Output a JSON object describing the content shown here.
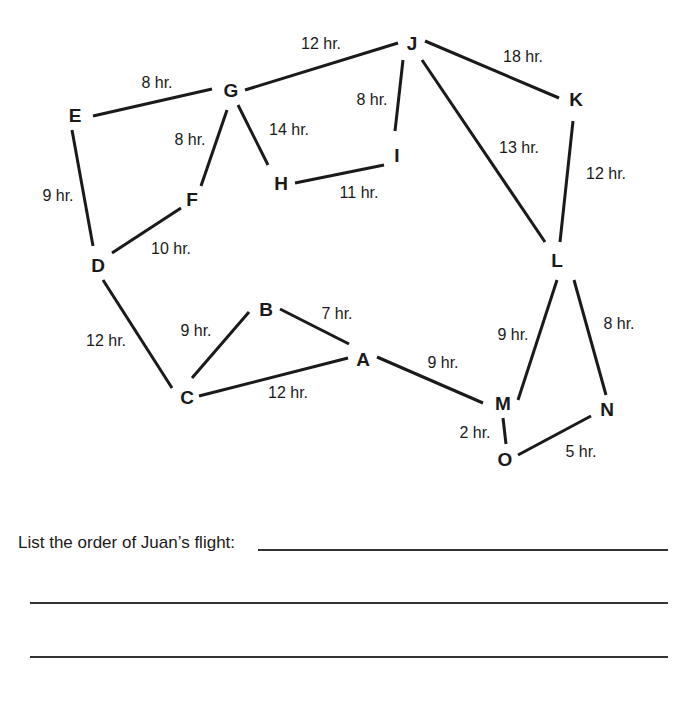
{
  "diagram": {
    "nodes": [
      {
        "id": "A",
        "label": "A",
        "x": 363,
        "y": 359
      },
      {
        "id": "B",
        "label": "B",
        "x": 266,
        "y": 309
      },
      {
        "id": "C",
        "label": "C",
        "x": 187,
        "y": 397
      },
      {
        "id": "D",
        "label": "D",
        "x": 98,
        "y": 265
      },
      {
        "id": "E",
        "label": "E",
        "x": 75,
        "y": 115
      },
      {
        "id": "F",
        "label": "F",
        "x": 192,
        "y": 199
      },
      {
        "id": "G",
        "label": "G",
        "x": 231,
        "y": 90
      },
      {
        "id": "H",
        "label": "H",
        "x": 281,
        "y": 183
      },
      {
        "id": "I",
        "label": "I",
        "x": 397,
        "y": 155
      },
      {
        "id": "J",
        "label": "J",
        "x": 412,
        "y": 43
      },
      {
        "id": "K",
        "label": "K",
        "x": 576,
        "y": 99
      },
      {
        "id": "L",
        "label": "L",
        "x": 557,
        "y": 260
      },
      {
        "id": "M",
        "label": "M",
        "x": 503,
        "y": 403
      },
      {
        "id": "N",
        "label": "N",
        "x": 607,
        "y": 409
      },
      {
        "id": "O",
        "label": "O",
        "x": 505,
        "y": 459
      }
    ],
    "edges": [
      {
        "from": "E",
        "to": "G",
        "label": "8 hr.",
        "x1": 93,
        "y1": 116,
        "x2": 212,
        "y2": 89,
        "lx": 157,
        "ly": 82
      },
      {
        "from": "G",
        "to": "J",
        "label": "12 hr.",
        "x1": 245,
        "y1": 90,
        "x2": 398,
        "y2": 43,
        "lx": 321,
        "ly": 43
      },
      {
        "from": "G",
        "to": "F",
        "label": "8 hr.",
        "x1": 227,
        "y1": 110,
        "x2": 201,
        "y2": 186,
        "lx": 190,
        "ly": 139
      },
      {
        "from": "G",
        "to": "H",
        "label": "14 hr.",
        "x1": 238,
        "y1": 105,
        "x2": 268,
        "y2": 165,
        "lx": 289,
        "ly": 129
      },
      {
        "from": "H",
        "to": "I",
        "label": "11 hr.",
        "x1": 295,
        "y1": 183,
        "x2": 384,
        "y2": 165,
        "lx": 359,
        "ly": 192
      },
      {
        "from": "J",
        "to": "I",
        "label": "8 hr.",
        "x1": 403,
        "y1": 60,
        "x2": 395,
        "y2": 131,
        "lx": 372,
        "ly": 99
      },
      {
        "from": "J",
        "to": "K",
        "label": "18 hr.",
        "x1": 425,
        "y1": 41,
        "x2": 559,
        "y2": 98,
        "lx": 523,
        "ly": 56
      },
      {
        "from": "J",
        "to": "L",
        "label": "13 hr.",
        "x1": 422,
        "y1": 60,
        "x2": 545,
        "y2": 242,
        "lx": 519,
        "ly": 147
      },
      {
        "from": "K",
        "to": "L",
        "label": "12 hr.",
        "x1": 573,
        "y1": 121,
        "x2": 560,
        "y2": 242,
        "lx": 606,
        "ly": 173
      },
      {
        "from": "E",
        "to": "D",
        "label": "9 hr.",
        "x1": 72,
        "y1": 130,
        "x2": 93,
        "y2": 246,
        "lx": 58,
        "ly": 195
      },
      {
        "from": "D",
        "to": "F",
        "label": "10 hr.",
        "x1": 112,
        "y1": 253,
        "x2": 181,
        "y2": 208,
        "lx": 171,
        "ly": 248
      },
      {
        "from": "D",
        "to": "C",
        "label": "12 hr.",
        "x1": 103,
        "y1": 280,
        "x2": 172,
        "y2": 388,
        "lx": 106,
        "ly": 340
      },
      {
        "from": "C",
        "to": "B",
        "label": "9 hr.",
        "x1": 192,
        "y1": 378,
        "x2": 249,
        "y2": 312,
        "lx": 196,
        "ly": 330
      },
      {
        "from": "C",
        "to": "A",
        "label": "12 hr.",
        "x1": 199,
        "y1": 396,
        "x2": 348,
        "y2": 358,
        "lx": 288,
        "ly": 392
      },
      {
        "from": "B",
        "to": "A",
        "label": "7 hr.",
        "x1": 280,
        "y1": 309,
        "x2": 349,
        "y2": 344,
        "lx": 337,
        "ly": 313
      },
      {
        "from": "A",
        "to": "M",
        "label": "9 hr.",
        "x1": 377,
        "y1": 357,
        "x2": 483,
        "y2": 403,
        "lx": 443,
        "ly": 362
      },
      {
        "from": "L",
        "to": "M",
        "label": "9 hr.",
        "x1": 557,
        "y1": 280,
        "x2": 518,
        "y2": 400,
        "lx": 513,
        "ly": 334
      },
      {
        "from": "L",
        "to": "N",
        "label": "8 hr.",
        "x1": 574,
        "y1": 280,
        "x2": 606,
        "y2": 395,
        "lx": 619,
        "ly": 323
      },
      {
        "from": "M",
        "to": "O",
        "label": "2 hr.",
        "x1": 503,
        "y1": 418,
        "x2": 506,
        "y2": 444,
        "lx": 475,
        "ly": 432
      },
      {
        "from": "O",
        "to": "N",
        "label": "5 hr.",
        "x1": 518,
        "y1": 455,
        "x2": 591,
        "y2": 416,
        "lx": 581,
        "ly": 451
      }
    ]
  },
  "worksheet": {
    "prompt": "List the order of Juan’s flight:",
    "answer_lines": 3
  }
}
